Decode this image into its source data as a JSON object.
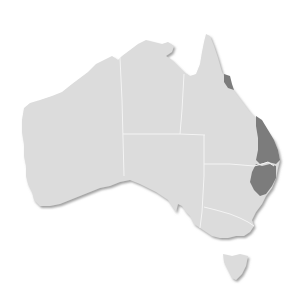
{
  "map": {
    "title": "Australia",
    "background": "#ffffff",
    "land_color": "#dcdcdc",
    "border_color": "#f4f4f4",
    "shadow_color": "#9a9a9a",
    "highlight_color": "#7c7c7c",
    "regions": [
      {
        "name": "Western Australia",
        "highlighted": false
      },
      {
        "name": "Northern Territory",
        "highlighted": false
      },
      {
        "name": "South Australia",
        "highlighted": false
      },
      {
        "name": "Queensland",
        "highlighted": false
      },
      {
        "name": "New South Wales",
        "highlighted": false
      },
      {
        "name": "Victoria",
        "highlighted": false
      },
      {
        "name": "Tasmania",
        "highlighted": false
      }
    ],
    "highlighted_areas": [
      {
        "name": "North Queensland coast (Cairns region)",
        "color": "#7c7c7c"
      },
      {
        "name": "South-East Queensland coast",
        "color": "#7c7c7c"
      },
      {
        "name": "Northern NSW coast",
        "color": "#7c7c7c"
      }
    ]
  }
}
